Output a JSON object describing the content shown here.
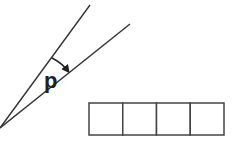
{
  "diagram": {
    "type": "angle-with-answer-boxes",
    "angle": {
      "label": "p",
      "vertex": [
        0,
        128
      ],
      "ray_upper_end": [
        90,
        5
      ],
      "ray_lower_end": [
        130,
        24
      ],
      "arc_marker": "arrow-pointing-to-lower-ray",
      "line_color": "#333333"
    },
    "answer_boxes": {
      "count": 4,
      "x": 89,
      "y": 103,
      "cell_width": 33.75,
      "cell_height": 32,
      "stroke_color": "#444444",
      "values": [
        "",
        "",
        "",
        ""
      ]
    }
  }
}
